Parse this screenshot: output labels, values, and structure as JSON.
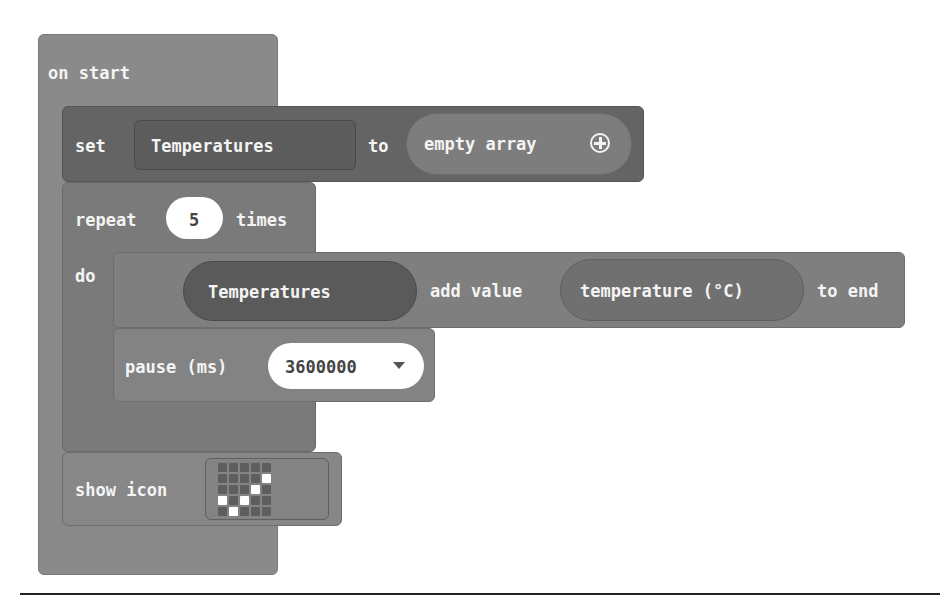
{
  "workspace": {
    "on_start": {
      "label": "on start"
    },
    "set_block": {
      "keyword": "set",
      "variable": "Temperatures",
      "to_label": "to",
      "value_label": "empty array",
      "value_icon": "plus-circle-icon"
    },
    "repeat_block": {
      "keyword": "repeat",
      "count": "5",
      "times_label": "times",
      "do_label": "do"
    },
    "add_value_block": {
      "array": "Temperatures",
      "add_label": "add value",
      "value": "temperature (°C)",
      "end_label": "to end"
    },
    "pause_block": {
      "label": "pause (ms)",
      "value": "3600000",
      "dropdown_icon": "dropdown-arrow-icon"
    },
    "show_icon_block": {
      "label": "show icon",
      "led_pattern": [
        [
          0,
          0,
          0,
          0,
          0
        ],
        [
          0,
          0,
          0,
          0,
          1
        ],
        [
          0,
          0,
          0,
          1,
          0
        ],
        [
          1,
          0,
          1,
          0,
          0
        ],
        [
          0,
          1,
          0,
          0,
          0
        ]
      ],
      "icon_name": "yes"
    }
  },
  "colors": {
    "hat_block": "#8a8a8a",
    "set_block": "#646464",
    "repeat_block": "#7a7a7a",
    "led_on": "#ffffff",
    "led_off": "#5e5e5e"
  }
}
